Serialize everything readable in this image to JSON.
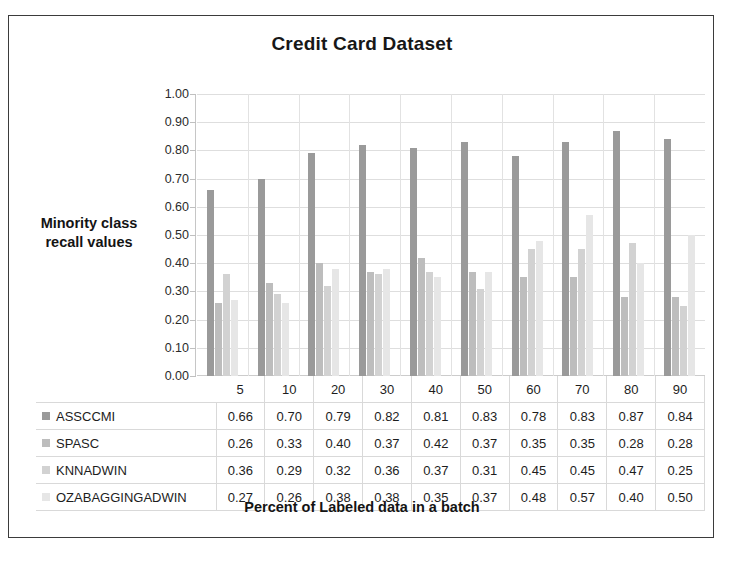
{
  "figure": {
    "border_color": "#3b3b3b",
    "background": "#ffffff"
  },
  "chart_data": {
    "type": "bar",
    "title": "Credit Card Dataset",
    "xlabel": "Percent of Labeled data in a batch",
    "ylabel": "Minority class recall values",
    "ylim": [
      0.0,
      1.0
    ],
    "ytick_step": 0.1,
    "grid": true,
    "legend_position": "data-table-left",
    "categories": [
      "5",
      "10",
      "20",
      "30",
      "40",
      "50",
      "60",
      "70",
      "80",
      "90"
    ],
    "ytick_labels": [
      "1.00",
      "0.90",
      "0.80",
      "0.70",
      "0.60",
      "0.50",
      "0.40",
      "0.30",
      "0.20",
      "0.10",
      "0.00"
    ],
    "series": [
      {
        "name": "ASSCCMI",
        "color": "#9a9a9a",
        "values": [
          0.66,
          0.7,
          0.79,
          0.82,
          0.81,
          0.83,
          0.78,
          0.83,
          0.87,
          0.84
        ]
      },
      {
        "name": "SPASC",
        "color": "#bdbdbd",
        "values": [
          0.26,
          0.33,
          0.4,
          0.37,
          0.42,
          0.37,
          0.35,
          0.35,
          0.28,
          0.28
        ]
      },
      {
        "name": "KNNADWIN",
        "color": "#d2d2d2",
        "values": [
          0.36,
          0.29,
          0.32,
          0.36,
          0.37,
          0.31,
          0.45,
          0.45,
          0.47,
          0.25
        ]
      },
      {
        "name": "OZABAGGINGADWIN",
        "color": "#e6e6e6",
        "values": [
          0.27,
          0.26,
          0.38,
          0.38,
          0.35,
          0.37,
          0.48,
          0.57,
          0.4,
          0.5
        ]
      }
    ]
  }
}
